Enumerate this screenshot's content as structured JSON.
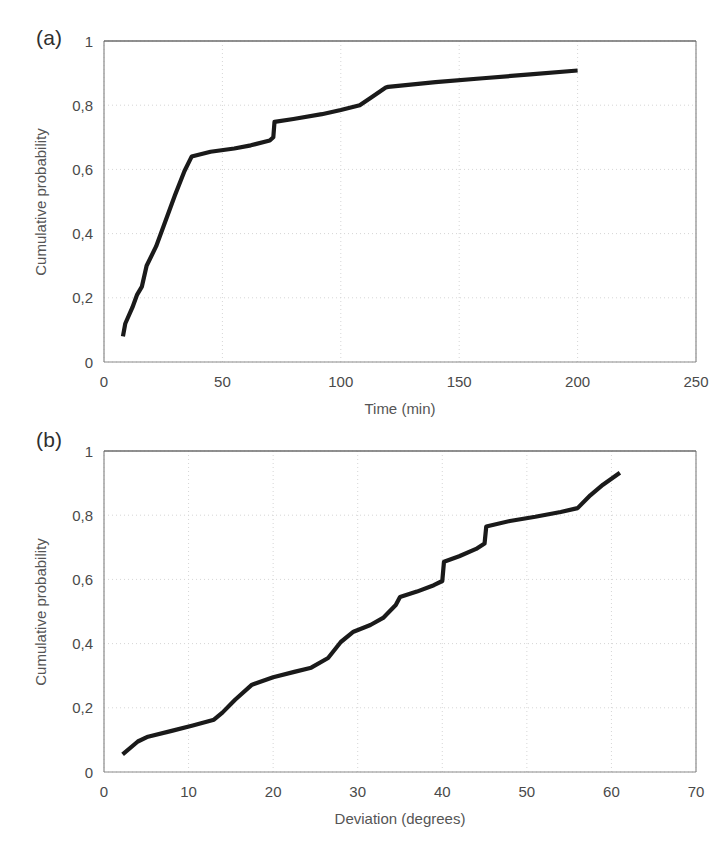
{
  "figure": {
    "background_color": "#ffffff",
    "line_color": "#1a1a1a",
    "grid_color": "#d6d6d6",
    "axis_color": "#8a8a8a",
    "text_color": "#4a4a4a"
  },
  "panels": [
    {
      "label": "(a)",
      "ylabel": "Cumulative probability",
      "xlabel": "Time (min)"
    },
    {
      "label": "(b)",
      "ylabel": "Cumulative probability",
      "xlabel": "Deviation (degrees)"
    }
  ],
  "chart_data": [
    {
      "type": "line",
      "title": "(a)",
      "xlabel": "Time (min)",
      "ylabel": "Cumulative probability",
      "xlim": [
        0,
        250
      ],
      "ylim": [
        0,
        1
      ],
      "xticks": [
        0,
        50,
        100,
        150,
        200,
        250
      ],
      "yticks": [
        0,
        0.2,
        0.4,
        0.6,
        0.8,
        1
      ],
      "xtick_labels": [
        "0",
        "50",
        "100",
        "150",
        "200",
        "250"
      ],
      "ytick_labels": [
        "0",
        "0,2",
        "0,4",
        "0,6",
        "0,8",
        "1"
      ],
      "grid": true,
      "legend": "none",
      "series": [
        {
          "name": "Cumulative distribution of time",
          "x": [
            8,
            9,
            12,
            14,
            16,
            18,
            22,
            26,
            30,
            34,
            37,
            45,
            55,
            62,
            70,
            71.5,
            72,
            80,
            92,
            100,
            108,
            113,
            119,
            120,
            140,
            160,
            180,
            200
          ],
          "y": [
            0.08,
            0.12,
            0.17,
            0.21,
            0.235,
            0.3,
            0.36,
            0.44,
            0.52,
            0.595,
            0.64,
            0.655,
            0.665,
            0.675,
            0.69,
            0.7,
            0.748,
            0.757,
            0.772,
            0.785,
            0.8,
            0.825,
            0.855,
            0.857,
            0.872,
            0.884,
            0.896,
            0.908
          ]
        }
      ]
    },
    {
      "type": "line",
      "title": "(b)",
      "xlabel": "Deviation (degrees)",
      "ylabel": "Cumulative probability",
      "xlim": [
        0,
        70
      ],
      "ylim": [
        0,
        1
      ],
      "xticks": [
        0,
        10,
        20,
        30,
        40,
        50,
        60,
        70
      ],
      "yticks": [
        0,
        0.2,
        0.4,
        0.6,
        0.8,
        1
      ],
      "xtick_labels": [
        "0",
        "10",
        "20",
        "30",
        "40",
        "50",
        "60",
        "70"
      ],
      "ytick_labels": [
        "0",
        "0,2",
        "0,4",
        "0,6",
        "0,8",
        "1"
      ],
      "grid": true,
      "legend": "none",
      "series": [
        {
          "name": "Cumulative distribution of deviation",
          "x": [
            2.2,
            4.0,
            5.2,
            8.0,
            10.5,
            13.0,
            14.0,
            15.5,
            17.5,
            20.0,
            22.5,
            24.5,
            26.5,
            28.0,
            29.5,
            31.5,
            33.0,
            34.5,
            35.0,
            37.0,
            39.0,
            40.0,
            40.2,
            42.0,
            44.0,
            45.0,
            45.2,
            48.0,
            51.0,
            54.0,
            56.0,
            57.5,
            59.0,
            61.0
          ],
          "y": [
            0.055,
            0.095,
            0.11,
            0.128,
            0.145,
            0.163,
            0.185,
            0.225,
            0.272,
            0.295,
            0.312,
            0.325,
            0.355,
            0.405,
            0.437,
            0.458,
            0.48,
            0.52,
            0.545,
            0.562,
            0.582,
            0.595,
            0.655,
            0.672,
            0.695,
            0.712,
            0.765,
            0.782,
            0.795,
            0.81,
            0.822,
            0.862,
            0.895,
            0.932
          ]
        }
      ]
    }
  ]
}
